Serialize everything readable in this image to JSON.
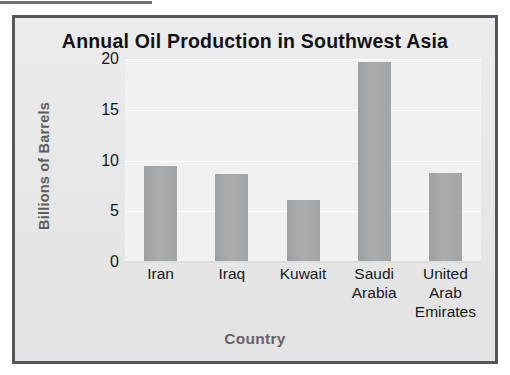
{
  "figure": {
    "background_color": "#e8e8e8",
    "frame_color": "#55565a",
    "plot_background_color": "#f1f1f1",
    "bar_color": "#a8a9ab",
    "gridline_color": "#ffffff",
    "title_color": "#111215",
    "axis_title_color": "#5d5e62"
  },
  "chart_data": {
    "type": "bar",
    "title": "Annual Oil Production in Southwest Asia",
    "xlabel": "Country",
    "ylabel": "Billions of Barrels",
    "categories": [
      "Iran",
      "Iraq",
      "Kuwait",
      "Saudi Arabia",
      "United Arab Emirates"
    ],
    "category_lines": [
      [
        "Iran"
      ],
      [
        "Iraq"
      ],
      [
        "Kuwait"
      ],
      [
        "Saudi",
        "Arabia"
      ],
      [
        "United",
        "Arab",
        "Emirates"
      ]
    ],
    "values": [
      9.5,
      8.7,
      6.1,
      19.7,
      8.8
    ],
    "ylim": [
      0,
      20
    ],
    "yticks": [
      0,
      5,
      10,
      15,
      20
    ],
    "ytick_labels": [
      "0",
      "5",
      "10",
      "15",
      "20"
    ],
    "grid": true,
    "grid_axis": "y",
    "legend": false
  }
}
